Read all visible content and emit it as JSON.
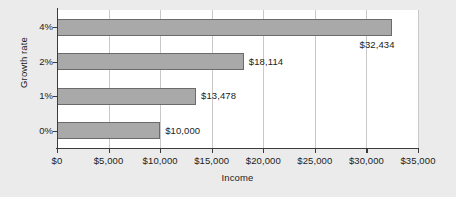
{
  "chart_data": {
    "type": "bar",
    "orientation": "horizontal",
    "title": "",
    "xlabel": "Income",
    "ylabel": "Growth rate",
    "categories": [
      "0%",
      "1%",
      "2%",
      "4%"
    ],
    "values": [
      10000,
      13478,
      18114,
      32434
    ],
    "data_labels": [
      "$10,000",
      "$13,478",
      "$18,114",
      "$32,434"
    ],
    "xlim": [
      0,
      35000
    ],
    "xticks": [
      0,
      5000,
      10000,
      15000,
      20000,
      25000,
      30000,
      35000
    ],
    "xticklabels": [
      "$0",
      "$5,000",
      "$10,000",
      "$15,000",
      "$20,000",
      "$25,000",
      "$30,000",
      "$35,000"
    ],
    "grid": "vertical",
    "legend": "none",
    "colors": {
      "bar_fill": "#a9a9a9",
      "bar_border": "#6b6b6b",
      "plot_background": "#ffffff",
      "page_background": "#ebebeb",
      "gridline": "#c9c9c9",
      "axis": "#3b3b3b",
      "text": "#1c1c1c"
    }
  }
}
